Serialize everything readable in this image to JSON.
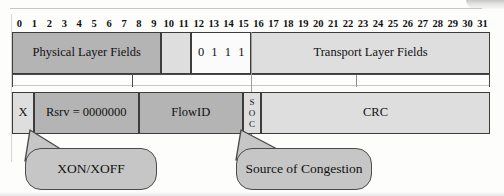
{
  "diagram": {
    "bit_ruler": {
      "label": "bit positions",
      "bits": [
        "0",
        "1",
        "2",
        "3",
        "4",
        "5",
        "6",
        "7",
        "8",
        "9",
        "10",
        "11",
        "12",
        "13",
        "14",
        "15",
        "16",
        "17",
        "18",
        "19",
        "20",
        "21",
        "22",
        "23",
        "24",
        "25",
        "26",
        "27",
        "28",
        "29",
        "30",
        "31"
      ]
    },
    "row1": {
      "name": "upper-word",
      "fields": [
        {
          "label": "Physical Layer Fields",
          "start_bit": 0,
          "end_bit": 9,
          "shade": "dark"
        },
        {
          "label": "",
          "start_bit": 10,
          "end_bit": 11,
          "shade": "light"
        },
        {
          "label": "",
          "start_bit": 12,
          "end_bit": 15,
          "shade": "white",
          "bits": [
            "0",
            "1",
            "1",
            "1"
          ]
        },
        {
          "label": "Transport Layer Fields",
          "start_bit": 16,
          "end_bit": 31,
          "shade": "light"
        }
      ]
    },
    "row2": {
      "name": "lower-word",
      "fields": [
        {
          "label": "X",
          "start_bit": 0,
          "end_bit": 0,
          "shade": "light"
        },
        {
          "label": "Rsrv = 0000000",
          "start_bit": 1,
          "end_bit": 7,
          "shade": "dark"
        },
        {
          "label": "FlowID",
          "start_bit": 8,
          "end_bit": 14,
          "shade": "dark"
        },
        {
          "label": "SOC",
          "letters": [
            "S",
            "O",
            "C"
          ],
          "start_bit": 15,
          "end_bit": 15,
          "shade": "light",
          "orientation": "vertical"
        },
        {
          "label": "CRC",
          "start_bit": 16,
          "end_bit": 31,
          "shade": "light"
        }
      ]
    },
    "callouts": [
      {
        "text": "XON/XOFF",
        "points_to": "X"
      },
      {
        "text": "Source of Congestion",
        "points_to": "SOC"
      }
    ],
    "colors": {
      "dark_fill": "#b4b4b4",
      "light_fill": "#dedede",
      "white_fill": "#fbfbfb",
      "bubble_fill": "#c6c6c6",
      "stroke": "#3c3c3c",
      "page_background": "#fdfdfc"
    }
  }
}
